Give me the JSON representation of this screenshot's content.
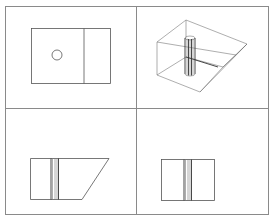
{
  "figure": {
    "type": "orthographic-and-isometric-views",
    "layout": "2x2 grid",
    "frame": {
      "x": 5,
      "y": 6,
      "w": 263,
      "h": 208,
      "divider_x": 136,
      "divider_y": 108
    },
    "colors": {
      "frame": "#8a8a8a",
      "lines": "#555555",
      "background": "#ffffff"
    },
    "views": [
      {
        "id": "top-view",
        "position": "top-left"
      },
      {
        "id": "isometric-view",
        "position": "top-right"
      },
      {
        "id": "front-view",
        "position": "bottom-left"
      },
      {
        "id": "side-view",
        "position": "bottom-right"
      }
    ]
  }
}
